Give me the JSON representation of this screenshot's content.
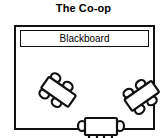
{
  "title": "The Co-op",
  "room": {
    "blackboard": {
      "label": "Blackboard"
    },
    "tables": [
      {
        "id": "table-left",
        "name": "left-table",
        "orientation": "diagonal-down-right",
        "rotation_deg": 35,
        "seats": 4,
        "shape": "rectangle"
      },
      {
        "id": "table-right",
        "name": "right-table",
        "orientation": "diagonal-down-left",
        "rotation_deg": -35,
        "seats": 4,
        "shape": "rectangle"
      },
      {
        "id": "table-center",
        "name": "center-table",
        "orientation": "horizontal",
        "rotation_deg": 0,
        "seats": 4,
        "shape": "rectangle"
      }
    ]
  },
  "colors": {
    "ink": "#111111",
    "paper": "#ffffff"
  }
}
